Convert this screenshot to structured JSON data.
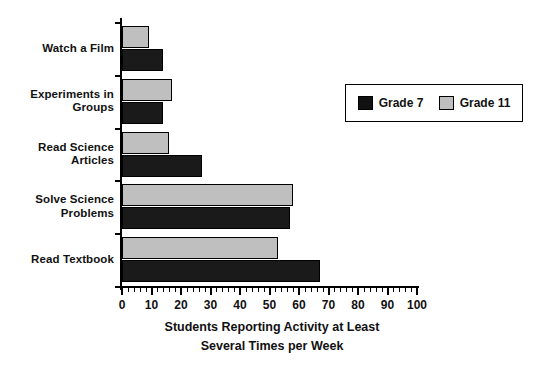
{
  "chart_data": {
    "type": "bar",
    "orientation": "horizontal",
    "title": "",
    "xlabel": "Students Reporting Activity at Least Several Times per Week",
    "xlabel_lines": [
      "Students Reporting Activity at Least",
      "Several Times per Week"
    ],
    "ylabel": "",
    "categories": [
      "Watch a Film",
      "Experiments in Groups",
      "Read Science Articles",
      "Solve Science Problems",
      "Read Textbook"
    ],
    "category_lines": [
      [
        "Watch a Film"
      ],
      [
        "Experiments in",
        "Groups"
      ],
      [
        "Read Science",
        "Articles"
      ],
      [
        "Solve Science",
        "Problems"
      ],
      [
        "Read Textbook"
      ]
    ],
    "series": [
      {
        "name": "Grade 7",
        "color": "#111111",
        "values": [
          14,
          14,
          27,
          57,
          67
        ]
      },
      {
        "name": "Grade 11",
        "color": "#bfbfbf",
        "values": [
          9,
          17,
          16,
          58,
          53
        ]
      }
    ],
    "xlim": [
      0,
      100
    ],
    "xticks": [
      0,
      10,
      20,
      30,
      40,
      50,
      60,
      70,
      80,
      90,
      100
    ],
    "xtick_labels": [
      "0",
      "10",
      "20",
      "30",
      "40",
      "50",
      "60",
      "70",
      "80",
      "90",
      "100"
    ],
    "minor_tick_step": 2,
    "grid": false,
    "legend_position": "upper right (inside plot)",
    "legend_entries": [
      "Grade 7",
      "Grade 11"
    ]
  },
  "legend": {
    "entries": [
      {
        "label": "Grade 7"
      },
      {
        "label": "Grade 11"
      }
    ]
  }
}
